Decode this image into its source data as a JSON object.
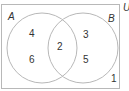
{
  "universe_label": "U",
  "sets": [
    {
      "label": "A",
      "only": [
        "4",
        "6"
      ]
    },
    {
      "label": "B",
      "only": [
        "3",
        "5"
      ]
    }
  ],
  "intersection": [
    "2"
  ],
  "outside": [
    "1"
  ],
  "colors": {
    "stroke": "#b8b8b8",
    "text": "#333333"
  }
}
